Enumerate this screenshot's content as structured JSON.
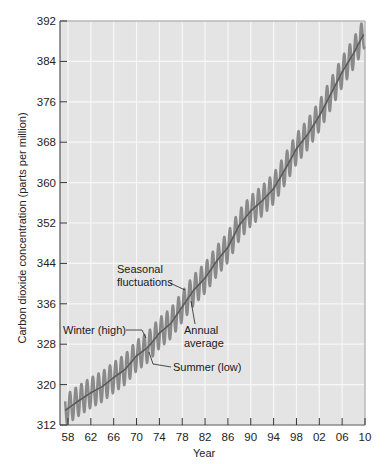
{
  "chart_data": {
    "type": "line",
    "title": "",
    "xlabel": "Year",
    "ylabel": "Carbon dioxide concentration (parts per million)",
    "xlim": [
      1956.6,
      2010
    ],
    "ylim": [
      312,
      392
    ],
    "grid": true,
    "legend": null,
    "x_tick_labels": [
      "58",
      "62",
      "66",
      "70",
      "74",
      "78",
      "82",
      "86",
      "90",
      "94",
      "98",
      "02",
      "06",
      "10"
    ],
    "x_tick_years": [
      1958,
      1962,
      1966,
      1970,
      1974,
      1978,
      1982,
      1986,
      1990,
      1994,
      1998,
      2002,
      2006,
      2010
    ],
    "y_ticks": [
      312,
      320,
      328,
      336,
      344,
      352,
      360,
      368,
      376,
      384,
      392
    ],
    "series": [
      {
        "name": "Annual average",
        "x": [
          1958,
          1960,
          1962,
          1964,
          1966,
          1968,
          1970,
          1972,
          1974,
          1976,
          1978,
          1980,
          1982,
          1984,
          1986,
          1988,
          1990,
          1992,
          1994,
          1996,
          1998,
          2000,
          2002,
          2004,
          2006,
          2008,
          2010
        ],
        "values": [
          315.3,
          316.9,
          318.4,
          319.6,
          321.4,
          323.0,
          325.7,
          327.4,
          330.2,
          332.1,
          335.4,
          338.7,
          341.1,
          344.4,
          347.2,
          351.6,
          354.4,
          356.4,
          358.8,
          362.6,
          366.7,
          369.6,
          373.2,
          377.5,
          381.9,
          385.6,
          389.9
        ]
      },
      {
        "name": "Seasonal fluctuations",
        "seasonal_amplitude_ppm": 3.0,
        "description": "Monthly values oscillating about the annual average: winter highs, summer lows"
      }
    ],
    "annotations": [
      {
        "text": "Seasonal fluctuations",
        "points_to": "oscillating curve near 1979"
      },
      {
        "text": "Winter (high)",
        "points_to": "peak near 1971"
      },
      {
        "text": "Annual average",
        "points_to": "smooth line near 1980"
      },
      {
        "text": "Summer (low)",
        "points_to": "trough near 1972"
      }
    ]
  },
  "labels": {
    "xlabel": "Year",
    "ylabel": "Carbon dioxide concentration (parts per million)",
    "annot_seasonal_1": "Seasonal",
    "annot_seasonal_2": "fluctuations",
    "annot_winter": "Winter (high)",
    "annot_annual_1": "Annual",
    "annot_annual_2": "average",
    "annot_summer": "Summer (low)"
  },
  "colors": {
    "plot_bg": "#e4e4e4",
    "grid": "#f7f7f7",
    "seasonal": "#8a8a8a",
    "annual": "#5a5a5a",
    "axis": "#555555"
  }
}
